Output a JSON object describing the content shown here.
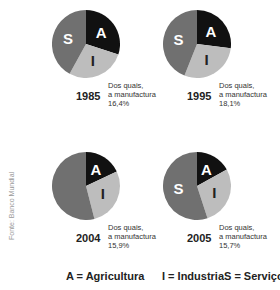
{
  "chart_data": [
    {
      "type": "pie",
      "title": "1985",
      "categories": [
        "A",
        "I",
        "S"
      ],
      "values": [
        30,
        28,
        42
      ],
      "note": [
        "Dos quais,",
        "a manufactura",
        "16,4%"
      ],
      "manufacturing_share": "16,4%"
    },
    {
      "type": "pie",
      "title": "1995",
      "categories": [
        "A",
        "I",
        "S"
      ],
      "values": [
        27,
        29,
        44
      ],
      "note": [
        "Dos quais,",
        "a manufactura",
        "18,1%"
      ],
      "manufacturing_share": "18,1%"
    },
    {
      "type": "pie",
      "title": "2004",
      "categories": [
        "A",
        "I",
        "S"
      ],
      "values": [
        18,
        28,
        54
      ],
      "note": [
        "Dos quais,",
        "a manufactura",
        "15,9%"
      ],
      "manufacturing_share": "15,9%"
    },
    {
      "type": "pie",
      "title": "2005",
      "categories": [
        "A",
        "I",
        "S"
      ],
      "values": [
        17,
        28,
        55
      ],
      "note": [
        "Dos quais,",
        "a manufactura",
        "15,7%"
      ],
      "manufacturing_share": "15,7%"
    }
  ],
  "colors": {
    "A": "#111111",
    "I": "#bdbdbd",
    "S": "#707070"
  },
  "legend": {
    "a": "A = Agricultura",
    "i": "I = Industria",
    "s": "S = Serviços"
  },
  "source": "Fonte: Banco Mundial"
}
